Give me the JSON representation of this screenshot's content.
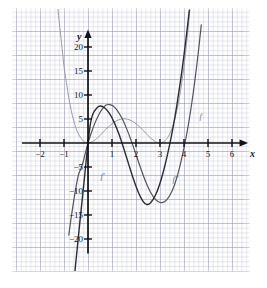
{
  "figure": {
    "kind": "function-graph",
    "background": "#ffffff",
    "paper_color": "#fdfdfe",
    "grid_minor_color": "#a5a8be",
    "grid_major_color": "#8c8ca5"
  },
  "axes": {
    "x_name": "x",
    "y_name": "y",
    "x_ticks": [
      {
        "value": -2,
        "label": "−2"
      },
      {
        "value": -1,
        "label": "−1"
      },
      {
        "value": 1,
        "label": "1"
      },
      {
        "value": 2,
        "label": "2"
      },
      {
        "value": 3,
        "label": "3"
      },
      {
        "value": 4,
        "label": "4"
      },
      {
        "value": 5,
        "label": "5"
      },
      {
        "value": 6,
        "label": "6"
      }
    ],
    "y_ticks": [
      {
        "value": 20,
        "label": "20"
      },
      {
        "value": 15,
        "label": "15"
      },
      {
        "value": 10,
        "label": "10"
      },
      {
        "value": 5,
        "label": "5"
      },
      {
        "value": -5,
        "label": "−5"
      },
      {
        "value": -10,
        "label": "−10"
      },
      {
        "value": -15,
        "label": "−15"
      },
      {
        "value": -20,
        "label": "−20"
      }
    ],
    "axis_color": "#121218"
  },
  "curve_labels": [
    {
      "id": "f",
      "text": "f",
      "x": 4.65,
      "y": 6.6,
      "color": "#7a7a86"
    },
    {
      "id": "fp",
      "text": "f′",
      "x": 0.52,
      "y": -5.9,
      "color": "#6e6e7a"
    },
    {
      "id": "fpp",
      "text": "f″",
      "x": 3.52,
      "y": -6.4,
      "color": "#6e6e7a"
    }
  ],
  "chart_data": {
    "type": "line",
    "title": "",
    "xlabel": "x",
    "ylabel": "y",
    "xlim": [
      -2.6,
      6.6
    ],
    "ylim": [
      -23,
      23
    ],
    "grid": true,
    "legend": "inline-curve-labels",
    "x_tick_values": [
      -2,
      -1,
      1,
      2,
      3,
      4,
      5,
      6
    ],
    "y_tick_values": [
      20,
      15,
      10,
      5,
      -5,
      -10,
      -15,
      -20
    ],
    "series": [
      {
        "name": "f",
        "label": "f",
        "color": "#9a9aa6",
        "width": 1.0,
        "formula": "f(x) = x^2 (x - 3)^2",
        "description": "quartic, roots (double) at x=0 and x=3, local max 5.06 at x=1.5, minima 0 at x=0 and x=3",
        "points": [
          [
            -1.3,
            30.4
          ],
          [
            -1.2,
            25.2
          ],
          [
            -1.1,
            20.7
          ],
          [
            -1.0,
            16.0
          ],
          [
            -0.9,
            12.6
          ],
          [
            -0.8,
            9.4
          ],
          [
            -0.7,
            6.8
          ],
          [
            -0.6,
            4.7
          ],
          [
            -0.5,
            3.1
          ],
          [
            -0.4,
            1.9
          ],
          [
            -0.3,
            1.1
          ],
          [
            -0.2,
            0.41
          ],
          [
            -0.1,
            0.1
          ],
          [
            0.0,
            0.0
          ],
          [
            0.2,
            0.31
          ],
          [
            0.4,
            1.09
          ],
          [
            0.6,
            2.07
          ],
          [
            0.8,
            3.14
          ],
          [
            1.0,
            4.0
          ],
          [
            1.2,
            4.67
          ],
          [
            1.5,
            5.06
          ],
          [
            1.8,
            4.67
          ],
          [
            2.0,
            4.0
          ],
          [
            2.2,
            3.14
          ],
          [
            2.4,
            2.07
          ],
          [
            2.6,
            1.09
          ],
          [
            2.8,
            0.31
          ],
          [
            3.0,
            0.0
          ],
          [
            3.2,
            0.41
          ],
          [
            3.4,
            1.85
          ],
          [
            3.6,
            4.67
          ],
          [
            3.8,
            9.26
          ],
          [
            4.0,
            16.0
          ],
          [
            4.2,
            25.4
          ],
          [
            4.35,
            34.4
          ],
          [
            4.5,
            45.6
          ]
        ]
      },
      {
        "name": "f'",
        "label": "f′",
        "color": "#53535e",
        "width": 1.2,
        "formula": "f′(x) = 4x^3 - 18x^2 + 18x",
        "description": "cubic, zeros at x=0, x≈0.63 region and x=3; local max ≈7.9 near x=0.75, local min ≈ -9.2 near x=3.2... crosses steeply downward at left",
        "points": [
          [
            -0.8,
            -19.2
          ],
          [
            -0.7,
            -15.5
          ],
          [
            -0.6,
            -12.2
          ],
          [
            -0.5,
            -9.2
          ],
          [
            -0.4,
            -6.7
          ],
          [
            -0.3,
            -5.4
          ],
          [
            -0.2,
            -3.9
          ],
          [
            -0.1,
            -1.9
          ],
          [
            0.0,
            0.0
          ],
          [
            0.15,
            2.3
          ],
          [
            0.3,
            4.3
          ],
          [
            0.45,
            5.9
          ],
          [
            0.6,
            7.1
          ],
          [
            0.75,
            7.9
          ],
          [
            0.9,
            8.0
          ],
          [
            1.05,
            7.7
          ],
          [
            1.2,
            6.9
          ],
          [
            1.4,
            5.3
          ],
          [
            1.6,
            3.1
          ],
          [
            1.8,
            0.5
          ],
          [
            2.0,
            -2.4
          ],
          [
            2.2,
            -5.3
          ],
          [
            2.4,
            -8.0
          ],
          [
            2.6,
            -10.2
          ],
          [
            2.8,
            -11.7
          ],
          [
            3.0,
            -12.4
          ],
          [
            3.2,
            -12.2
          ],
          [
            3.4,
            -11.0
          ],
          [
            3.6,
            -8.8
          ],
          [
            3.8,
            -5.4
          ],
          [
            4.0,
            -1.0
          ],
          [
            4.15,
            2.9
          ],
          [
            4.3,
            7.5
          ],
          [
            4.45,
            12.9
          ],
          [
            4.6,
            19.1
          ],
          [
            4.72,
            24.6
          ]
        ]
      },
      {
        "name": "f''",
        "label": "f″",
        "color": "#2c2c36",
        "width": 1.4,
        "formula": "f″(x) = 12x^2 - 36x + 18",
        "description": "upward parabola-like branch drawn as steep curve through origin region; minimum ≈ -9 near x=3.2, crosses zero near x=3.65",
        "points": [
          [
            -0.55,
            -27.0
          ],
          [
            -0.45,
            -22.0
          ],
          [
            -0.35,
            -17.0
          ],
          [
            -0.25,
            -12.2
          ],
          [
            -0.15,
            -7.4
          ],
          [
            -0.05,
            -2.4
          ],
          [
            0.0,
            0.0
          ],
          [
            0.1,
            4.0
          ],
          [
            0.2,
            6.0
          ],
          [
            0.35,
            7.2
          ],
          [
            0.5,
            7.7
          ],
          [
            0.7,
            7.3
          ],
          [
            0.9,
            6.1
          ],
          [
            1.1,
            4.2
          ],
          [
            1.3,
            1.7
          ],
          [
            1.5,
            -1.3
          ],
          [
            1.7,
            -4.5
          ],
          [
            1.9,
            -7.6
          ],
          [
            2.1,
            -10.3
          ],
          [
            2.3,
            -12.2
          ],
          [
            2.45,
            -12.8
          ],
          [
            2.6,
            -12.5
          ],
          [
            2.8,
            -11.0
          ],
          [
            3.0,
            -8.4
          ],
          [
            3.2,
            -4.8
          ],
          [
            3.4,
            -0.4
          ],
          [
            3.55,
            3.4
          ],
          [
            3.7,
            7.8
          ],
          [
            3.85,
            12.8
          ],
          [
            4.0,
            18.3
          ],
          [
            4.12,
            23.2
          ],
          [
            4.22,
            27.6
          ]
        ]
      }
    ]
  }
}
